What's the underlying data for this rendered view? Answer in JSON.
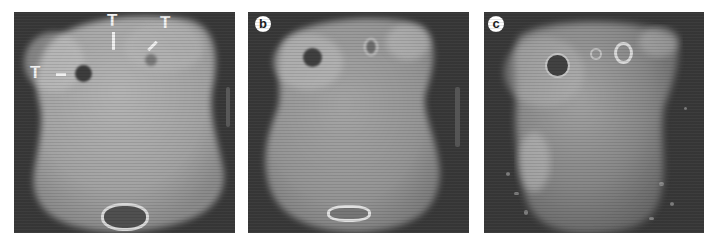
{
  "figure": {
    "panels": [
      {
        "id": "a",
        "label": "",
        "annotations": [
          {
            "text": "T",
            "marker": "horizontal-dash"
          },
          {
            "text": "T",
            "marker": "vertical-dash"
          },
          {
            "text": "T",
            "marker": "diagonal-dash"
          }
        ],
        "description": "planar scintigram with photopenic lesion and bladder region"
      },
      {
        "id": "b",
        "label": "b",
        "annotations": [],
        "description": "planar scintigram, later acquisition"
      },
      {
        "id": "c",
        "label": "c",
        "annotations": [],
        "description": "planar scintigram, late acquisition with noisy background"
      }
    ],
    "colors": {
      "background": "#ffffff",
      "panel_background": "#3a3a3a",
      "body_tone": "#a8a8a8",
      "lesion": "#3d3d3d",
      "label_circle": "#ffffff"
    }
  }
}
